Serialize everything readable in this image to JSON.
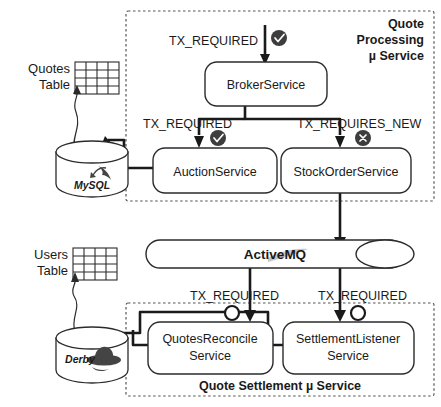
{
  "diagram": {
    "groups": [
      {
        "id": "processing",
        "label": "Quote\nProcessing\nµ Service",
        "label_line1": "Quote",
        "label_line2": "Processing",
        "label_line3": "µ Service"
      },
      {
        "id": "settlement",
        "label": "Quote Settlement µ Service"
      }
    ],
    "services": [
      {
        "id": "broker",
        "label": "BrokerService"
      },
      {
        "id": "auction",
        "label": "AuctionService"
      },
      {
        "id": "stockorder",
        "label": "StockOrderService"
      },
      {
        "id": "quotesreconcile",
        "label_line1": "QuotesReconcile",
        "label_line2": "Service"
      },
      {
        "id": "settlementlistener",
        "label_line1": "SettlementListener",
        "label_line2": "Service"
      }
    ],
    "transaction_labels": [
      {
        "id": "tx-broker-in",
        "text": "TX_REQUIRED",
        "badge": "check-badge"
      },
      {
        "id": "tx-auction",
        "text": "TX_REQUIRED",
        "badge": "check-badge"
      },
      {
        "id": "tx-stockorder",
        "text": "TX_REQUIRES_NEW",
        "badge": "cross-badge"
      },
      {
        "id": "tx-quotesreconcile",
        "text": "TX_REQUIRED",
        "badge": "hollow-badge"
      },
      {
        "id": "tx-settlementlistener",
        "text": "TX_REQUIRED",
        "badge": "hollow-badge"
      }
    ],
    "databases": [
      {
        "id": "mysql",
        "label": "MySQL",
        "table_label_line1": "Quotes",
        "table_label_line2": "Table"
      },
      {
        "id": "derby",
        "label": "Derby",
        "table_label_line1": "Users",
        "table_label_line2": "Table"
      }
    ],
    "broker_bus": {
      "id": "activemq",
      "label": "ActiveMQ"
    },
    "colors": {
      "stroke": "#2b2b2b",
      "connector": "#1a1a1a",
      "group_dash": "#555555",
      "badge_fill": "#3d3d3d",
      "activemq_text": "#2d2d2d",
      "background": "#ffffff"
    }
  }
}
